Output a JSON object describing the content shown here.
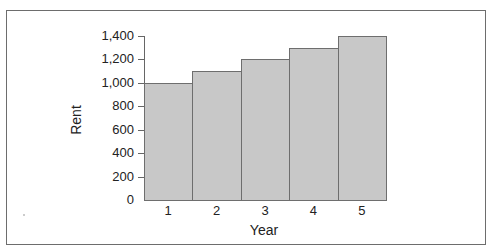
{
  "chart_data": {
    "type": "bar",
    "title": "",
    "xlabel": "Year",
    "ylabel": "Rent",
    "categories": [
      "1",
      "2",
      "3",
      "4",
      "5"
    ],
    "values": [
      1000,
      1100,
      1200,
      1300,
      1400
    ],
    "ylim": [
      0,
      1400
    ],
    "yticks": [
      "0",
      "200",
      "400",
      "600",
      "800",
      "1,000",
      "1,200",
      "1,400"
    ],
    "grid": false,
    "legend": null,
    "colors": {
      "bar_fill": "#c8c8c8",
      "bar_edge": "#6e6e6e",
      "frame": "#6d6d6d"
    }
  }
}
